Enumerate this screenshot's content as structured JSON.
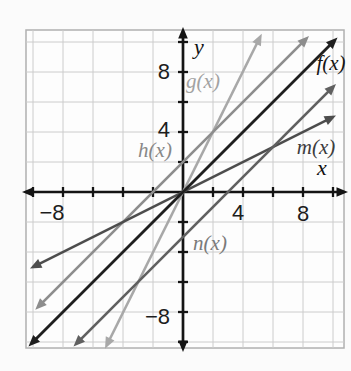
{
  "figure": {
    "background_color": "#fbfbfb",
    "plot_background_color": "#fdfdfd",
    "grid_color": "#cccccc",
    "border_color": "#b0b0b0",
    "axis_color": "#141414",
    "tick_text_color": "#1d1d1d"
  },
  "chart_data": {
    "type": "line",
    "title": "",
    "xlabel": "x",
    "ylabel": "y",
    "xlim": [
      -10.5,
      10.5
    ],
    "ylim": [
      -10.5,
      10.5
    ],
    "grid": true,
    "grid_spacing": 2,
    "tick_step": 2,
    "x_tick_labels": [
      {
        "value": -8,
        "label": "−8"
      },
      {
        "value": 4,
        "label": "4"
      },
      {
        "value": 8,
        "label": "8"
      }
    ],
    "y_tick_labels": [
      {
        "value": 8,
        "label": "8"
      },
      {
        "value": 4,
        "label": "4"
      },
      {
        "value": -8,
        "label": "−8"
      }
    ],
    "series": [
      {
        "name": "f(x)",
        "equation": "f(x) = x",
        "slope": 1,
        "y_intercept": 0,
        "color": "#1f1f1f",
        "label_color": "#161616",
        "points": [
          [
            -10,
            -10
          ],
          [
            10,
            10
          ]
        ]
      },
      {
        "name": "g(x)",
        "equation": "g(x) = 2x",
        "slope": 2,
        "y_intercept": 0,
        "color": "#a8a8a8",
        "label_color": "#a2a2a2",
        "points": [
          [
            -5,
            -10
          ],
          [
            5,
            10
          ]
        ]
      },
      {
        "name": "h(x)",
        "equation": "h(x) = x + 2",
        "slope": 1,
        "y_intercept": 2,
        "color": "#8d8d8d",
        "label_color": "#888888",
        "points": [
          [
            -10,
            -8
          ],
          [
            8,
            10
          ]
        ]
      },
      {
        "name": "m(x)",
        "equation": "m(x) = 0.5x",
        "slope": 0.5,
        "y_intercept": 0,
        "color": "#4d4d4d",
        "label_color": "#3c3c3c",
        "points": [
          [
            -10,
            -5
          ],
          [
            10,
            5
          ]
        ]
      },
      {
        "name": "n(x)",
        "equation": "n(x) = x − 3",
        "slope": 1,
        "y_intercept": -3,
        "color": "#606060",
        "label_color": "#7a7a7a",
        "points": [
          [
            -7,
            -10
          ],
          [
            10,
            7
          ]
        ]
      }
    ],
    "legend_position": "none",
    "annotations": "function names labeled beside each line; arrowheads on both ends of every line and axis"
  }
}
